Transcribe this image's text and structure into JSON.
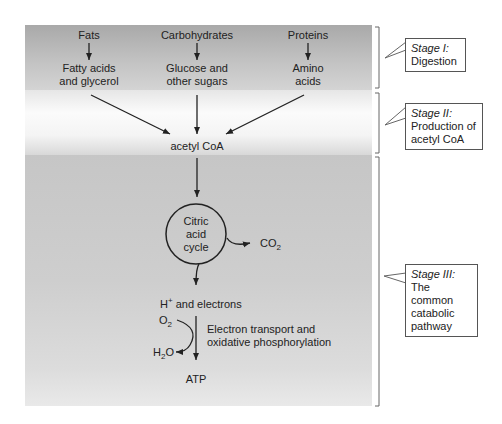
{
  "stages": [
    {
      "stage": "Stage I:",
      "description_lines": [
        "Digestion"
      ]
    },
    {
      "stage": "Stage II:",
      "description_lines": [
        "Production of",
        "acetyl CoA"
      ]
    },
    {
      "stage": "Stage III:",
      "description_lines": [
        "The common",
        "catabolic",
        "pathway"
      ]
    }
  ],
  "stage1": {
    "sources": [
      {
        "name": "Fats",
        "product_lines": [
          "Fatty acids",
          "and glycerol"
        ]
      },
      {
        "name": "Carbohydrates",
        "product_lines": [
          "Glucose and",
          "other sugars"
        ]
      },
      {
        "name": "Proteins",
        "product_lines": [
          "Amino",
          "acids"
        ]
      }
    ]
  },
  "stage2": {
    "product": "acetyl CoA"
  },
  "stage3": {
    "cycle_lines": [
      "Citric",
      "acid",
      "cycle"
    ],
    "co2": {
      "base": "CO",
      "sub": "2"
    },
    "h_electrons": {
      "base": "H",
      "sup": "+",
      "rest": " and electrons"
    },
    "o2": {
      "base": "O",
      "sub": "2"
    },
    "h2o": {
      "pre": "H",
      "sub": "2",
      "post": "O"
    },
    "etc_lines": [
      "Electron transport and",
      "oxidative phosphorylation"
    ],
    "atp": "ATP"
  },
  "colors": {
    "arrow": "#222222",
    "bracket": "#666666",
    "callout_border": "#555555"
  }
}
